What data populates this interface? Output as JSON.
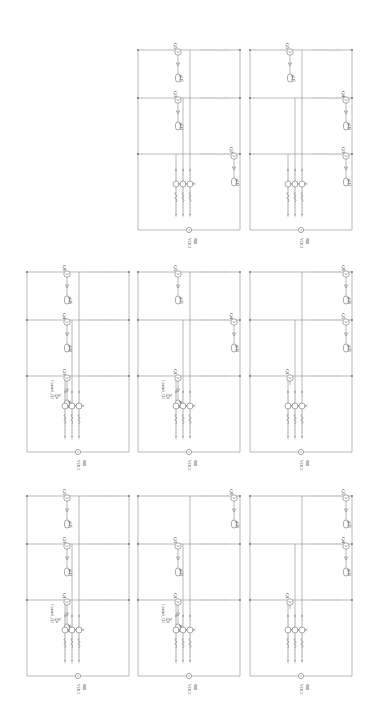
{
  "diagram": {
    "title": "",
    "orientation": "rotated-90-clockwise",
    "layout": {
      "rows": 3,
      "cols": 3
    },
    "colors": {
      "wire": "#8a8a8a",
      "component": "#707070",
      "text": "#333333",
      "background": "#ffffff"
    },
    "panels": [
      {
        "id": "r1c2",
        "row": 1,
        "col": 2,
        "source": {
          "name": "VDC1",
          "value": "800"
        },
        "switches": [
          {
            "label": "Q5",
            "gate": "gQ5",
            "column": 0
          },
          {
            "label": "Q3",
            "gate": "gQ3",
            "column": 1
          },
          {
            "label": "Q2",
            "gate": "gQ2",
            "column": 2
          }
        ],
        "control": null,
        "meters": [
          "V",
          "V",
          "V"
        ]
      },
      {
        "id": "r1c3",
        "row": 1,
        "col": 3,
        "source": {
          "name": "VDC1",
          "value": "800"
        },
        "switches": [
          {
            "label": "Q5",
            "gate": "gQ5",
            "column": 0
          },
          {
            "label": "Q4",
            "gate": "gQ4",
            "column": 2
          },
          {
            "label": "Q3",
            "gate": "gQ3",
            "column": 2
          }
        ],
        "control": null,
        "meters": [
          "V",
          "V",
          "V"
        ]
      },
      {
        "id": "r2c1",
        "row": 2,
        "col": 1,
        "source": {
          "name": "VDC1",
          "value": "800"
        },
        "switches": [
          {
            "label": "Q6",
            "gate": "gQ6",
            "column": 0
          },
          {
            "label": "Q4",
            "gate": "gQ4",
            "column": 0
          },
          {
            "label": "Q3",
            "gate": "gQ1",
            "column": 0
          }
        ],
        "control": {
          "label": "Control_Q1",
          "sub": "V",
          "gate": "gQ1"
        },
        "meters": [
          "V",
          "V",
          "V"
        ]
      },
      {
        "id": "r2c2",
        "row": 2,
        "col": 2,
        "source": {
          "name": "VDC1",
          "value": "800"
        },
        "switches": [
          {
            "label": "Q5",
            "gate": "gQ5",
            "column": 0
          },
          {
            "label": "Q4",
            "gate": "gQ4",
            "column": 2
          },
          {
            "label": "Q1",
            "gate": "gQ1",
            "column": 0
          }
        ],
        "control": {
          "label": "Control_Q1",
          "sub": "V",
          "gate": "gQ1"
        },
        "meters": [
          "V",
          "V",
          "V"
        ]
      },
      {
        "id": "r2c3",
        "row": 2,
        "col": 3,
        "source": {
          "name": "VDC1",
          "value": "800"
        },
        "switches": [
          {
            "label": "Q6",
            "gate": "gQ6",
            "column": 2
          },
          {
            "label": "Q5",
            "gate": "gQ5",
            "column": 2
          },
          {
            "label": "Q1",
            "gate": null,
            "column": 0
          }
        ],
        "control": null,
        "meters": [
          "V",
          "V",
          "V"
        ]
      },
      {
        "id": "r3c1",
        "row": 3,
        "col": 1,
        "source": {
          "name": "VDC1",
          "value": "800"
        },
        "switches": [
          {
            "label": "Q5",
            "gate": "gQ5",
            "column": 0
          },
          {
            "label": "Q3",
            "gate": "gQ3",
            "column": 0
          },
          {
            "label": "Q1",
            "gate": "gQ1",
            "column": 0
          }
        ],
        "control": {
          "label": "Control_Q1",
          "sub": "V",
          "gate": "gQ1"
        },
        "meters": [
          "V",
          "V",
          "V"
        ]
      },
      {
        "id": "r3c2",
        "row": 3,
        "col": 2,
        "source": {
          "name": "VDC1",
          "value": "800"
        },
        "switches": [
          {
            "label": "Q6",
            "gate": "gQ6",
            "column": 2
          },
          {
            "label": "Q3",
            "gate": "gQ3",
            "column": 0
          },
          {
            "label": "Q1",
            "gate": "gQ1",
            "column": 0
          }
        ],
        "control": {
          "label": "Control_Q1",
          "sub": "V",
          "gate": "gQ1"
        },
        "meters": [
          "V",
          "V",
          "V"
        ]
      },
      {
        "id": "r3c3",
        "row": 3,
        "col": 3,
        "source": {
          "name": "VDC1",
          "value": "800"
        },
        "switches": [
          {
            "label": "Q5",
            "gate": "gQ5",
            "column": 2
          },
          {
            "label": "Q4",
            "gate": "gQ4",
            "column": 2
          },
          {
            "label": "Q1",
            "gate": null,
            "column": 0
          }
        ],
        "control": null,
        "meters": [
          "V",
          "V",
          "V"
        ]
      }
    ]
  }
}
